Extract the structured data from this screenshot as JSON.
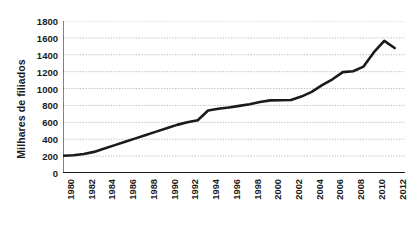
{
  "chart_data": {
    "type": "line",
    "title": "",
    "subtitle": "",
    "xlabel": "",
    "ylabel": "Milhares de filiados",
    "xlim": [
      1980,
      2013
    ],
    "ylim": [
      0,
      1800
    ],
    "ytick_step": 200,
    "xtick_step": 2,
    "grid": true,
    "grid_style": "dotted",
    "legend": false,
    "legend_position": "none",
    "line_color": "#1a1a1a",
    "grid_color": "#b9b9b9",
    "axis_color": "#1a1a1a",
    "background": "#ffffff",
    "ytick_labels": [
      "0",
      "200",
      "400",
      "600",
      "800",
      "1000",
      "1200",
      "1400",
      "1600",
      "1800"
    ],
    "ytick_values": [
      0,
      200,
      400,
      600,
      800,
      1000,
      1200,
      1400,
      1600,
      1800
    ],
    "xtick_labels": [
      "1980",
      "1982",
      "1984",
      "1986",
      "1988",
      "1990",
      "1992",
      "1994",
      "1996",
      "1998",
      "2000",
      "2002",
      "2004",
      "2006",
      "2008",
      "2010",
      "2012"
    ],
    "xtick_values": [
      1980,
      1982,
      1984,
      1986,
      1988,
      1990,
      1992,
      1994,
      1996,
      1998,
      2000,
      2002,
      2004,
      2006,
      2008,
      2010,
      2012
    ],
    "x": [
      1980,
      1981,
      1982,
      1983,
      1984,
      1985,
      1986,
      1987,
      1988,
      1989,
      1990,
      1991,
      1992,
      1993,
      1994,
      1995,
      1996,
      1997,
      1998,
      1999,
      2000,
      2001,
      2002,
      2003,
      2004,
      2005,
      2006,
      2007,
      2008,
      2009,
      2010,
      2011,
      2012
    ],
    "series": [
      {
        "name": "Filiados",
        "values": [
          205,
          210,
          225,
          250,
          290,
          330,
          370,
          410,
          450,
          490,
          530,
          570,
          600,
          625,
          740,
          760,
          775,
          795,
          815,
          840,
          860,
          862,
          865,
          905,
          960,
          1040,
          1110,
          1195,
          1205,
          1260,
          1430,
          1565,
          1480
        ]
      }
    ],
    "annotations": []
  }
}
